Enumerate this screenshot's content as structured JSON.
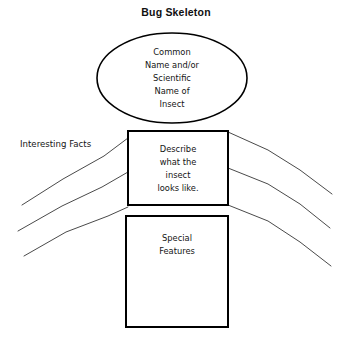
{
  "page": {
    "title": "Bug Skeleton",
    "background_color": "#ffffff",
    "ink_color": "#000000",
    "leg_color": "#4a4a4a",
    "width": 353,
    "height": 354
  },
  "diagram": {
    "type": "graphic-organizer",
    "head_ellipse": {
      "name": "head",
      "lines": [
        "Common",
        "Name and/or",
        "Scientific",
        "Name of",
        "Insect"
      ],
      "cx": 172,
      "cy": 78,
      "rx": 75,
      "ry": 45
    },
    "thorax_box": {
      "name": "thorax",
      "lines": [
        "Describe",
        "what the",
        "insect",
        "looks like."
      ],
      "x": 128,
      "y": 131,
      "width": 100,
      "height": 74
    },
    "abdomen_box": {
      "name": "abdomen",
      "lines": [
        "Special",
        "Features"
      ],
      "x": 126,
      "y": 216,
      "width": 102,
      "height": 111
    },
    "legs_label": {
      "text": "Interesting Facts",
      "x": 20,
      "y": 147
    },
    "legs": [
      {
        "side": "left",
        "points": "22,205 63,179 104,156 128,138"
      },
      {
        "side": "left",
        "points": "18,231 62,206 102,187 128,172"
      },
      {
        "side": "left",
        "points": "24,256 66,232 108,216 128,207"
      },
      {
        "side": "right",
        "points": "228,132 268,150 300,170 332,194"
      },
      {
        "side": "right",
        "points": "228,168 268,184 300,204 330,228"
      },
      {
        "side": "right",
        "points": "228,205 268,221 300,242 331,266"
      }
    ]
  }
}
